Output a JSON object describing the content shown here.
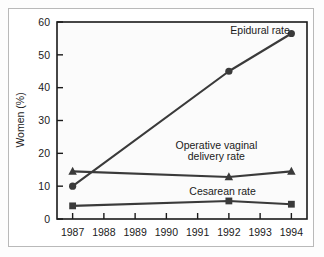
{
  "chart_data": {
    "type": "line",
    "title": "",
    "xlabel": "",
    "ylabel": "Women (%)",
    "xlim": [
      1986.5,
      1994.5
    ],
    "ylim": [
      0,
      60
    ],
    "ytick_values": [
      0,
      10,
      20,
      30,
      40,
      50,
      60
    ],
    "ytick_labels": [
      "0",
      "10",
      "20",
      "30",
      "40",
      "50",
      "60"
    ],
    "xtick_values": [
      1987,
      1988,
      1989,
      1990,
      1991,
      1992,
      1993,
      1994
    ],
    "xtick_labels": [
      "1987",
      "1988",
      "1989",
      "1990",
      "1991",
      "1992",
      "1993",
      "1994"
    ],
    "grid": false,
    "legend_position": "inline-annotations",
    "x": [
      1987,
      1992,
      1994
    ],
    "series": [
      {
        "name": "Epidural rate",
        "marker": "circle",
        "color": "#3a3a3a",
        "values": [
          10,
          45,
          56.5
        ],
        "label_lines": [
          "Epidural rate"
        ]
      },
      {
        "name": "Operative vaginal delivery rate",
        "marker": "triangle",
        "color": "#3a3a3a",
        "values": [
          14.5,
          12.8,
          14.5
        ],
        "label_lines": [
          "Operative vaginal",
          "delivery rate"
        ]
      },
      {
        "name": "Cesarean rate",
        "marker": "square",
        "color": "#3a3a3a",
        "values": [
          4,
          5.5,
          4.5
        ],
        "label_lines": [
          "Cesarean rate"
        ]
      }
    ],
    "annotations": [
      {
        "text": "Epidural rate",
        "x": 1993.0,
        "y": 57.5
      },
      {
        "text": "Operative vaginal",
        "x": 1991.6,
        "y": 22.5
      },
      {
        "text": "delivery rate",
        "x": 1991.6,
        "y": 19.0
      },
      {
        "text": "Cesarean rate",
        "x": 1991.8,
        "y": 8.5
      }
    ]
  },
  "colors": {
    "line": "#3a3a3a",
    "axis": "#1a1a1a",
    "plot_background": "#fbfbfb",
    "page_background": "#ffffff",
    "frame_border": "#b9b9b9",
    "text": "#1a1a1a"
  },
  "axes": {
    "y_title": "Women (%)",
    "y_labels": [
      "60",
      "50",
      "40",
      "30",
      "20",
      "10",
      "0"
    ],
    "x_labels": [
      "1987",
      "1988",
      "1989",
      "1990",
      "1991",
      "1992",
      "1993",
      "1994"
    ]
  },
  "labels": {
    "epidural": "Epidural rate",
    "operative_line1": "Operative vaginal",
    "operative_line2": "delivery rate",
    "cesarean": "Cesarean rate"
  }
}
